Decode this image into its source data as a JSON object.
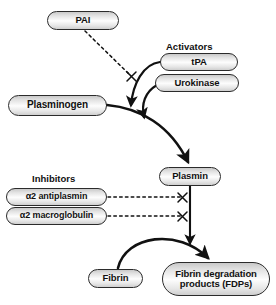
{
  "diagram": {
    "type": "flow-diagram",
    "colors": {
      "stroke": "#2b2b2b",
      "node_fill_light": "#fdfdfd",
      "node_fill_dark": "#c9c9c9",
      "background": "#ffffff",
      "text": "#111111"
    },
    "groups": {
      "activators_label": "Activators",
      "inhibitors_label": "Inhibitors"
    },
    "nodes": {
      "pai": "PAI",
      "tpa": "tPA",
      "urokinase": "Urokinase",
      "plasminogen": "Plasminogen",
      "plasmin": "Plasmin",
      "a2_antiplasmin": "α2 antiplasmin",
      "a2_macroglobulin": "α2 macroglobulin",
      "fibrin": "Fibrin",
      "fdp_line1": "Fibrin degradation",
      "fdp_line2": "products (FDPs)"
    },
    "edges": [
      {
        "from": "plasminogen",
        "to": "plasmin",
        "style": "solid-arrow",
        "meaning": "conversion"
      },
      {
        "from": "tpa",
        "to": "plasminogen-plasmin-arc",
        "style": "solid-arrow",
        "meaning": "activates"
      },
      {
        "from": "urokinase",
        "to": "plasminogen-plasmin-arc",
        "style": "solid-arrow",
        "meaning": "activates"
      },
      {
        "from": "pai",
        "to": "tpa-arrow",
        "style": "dashed-blocked",
        "meaning": "inhibits"
      },
      {
        "from": "a2_antiplasmin",
        "to": "plasmin-fibrin-line",
        "style": "dashed-blocked",
        "meaning": "inhibits"
      },
      {
        "from": "a2_macroglobulin",
        "to": "plasmin-fibrin-line",
        "style": "dashed-blocked",
        "meaning": "inhibits"
      },
      {
        "from": "plasmin",
        "to": "fibrin-fdp-arc",
        "style": "solid-arrow",
        "meaning": "acts on"
      },
      {
        "from": "fibrin",
        "to": "fdp",
        "style": "solid-arrow",
        "meaning": "degraded to"
      }
    ]
  }
}
